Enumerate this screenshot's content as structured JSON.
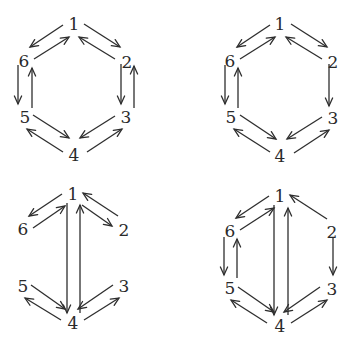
{
  "figure": {
    "panels": [
      {
        "id": "top-left",
        "nodes": [
          {
            "id": "1",
            "label": "1",
            "x": 74,
            "y": 24
          },
          {
            "id": "2",
            "label": "2",
            "x": 127,
            "y": 62
          },
          {
            "id": "3",
            "label": "3",
            "x": 126,
            "y": 117
          },
          {
            "id": "4",
            "label": "4",
            "x": 74,
            "y": 155
          },
          {
            "id": "5",
            "label": "5",
            "x": 25,
            "y": 117
          },
          {
            "id": "6",
            "label": "6",
            "x": 24,
            "y": 61
          }
        ],
        "edges": [
          {
            "from": "1",
            "to": "6",
            "x1": 63,
            "y1": 25,
            "x2": 30,
            "y2": 47
          },
          {
            "from": "6",
            "to": "1",
            "x1": 34,
            "y1": 59,
            "x2": 69,
            "y2": 37
          },
          {
            "from": "2",
            "to": "1",
            "x1": 115,
            "y1": 59,
            "x2": 79,
            "y2": 37
          },
          {
            "from": "1",
            "to": "2",
            "x1": 84,
            "y1": 24,
            "x2": 120,
            "y2": 47
          },
          {
            "from": "6",
            "to": "5",
            "x1": 18,
            "y1": 65,
            "x2": 18,
            "y2": 104
          },
          {
            "from": "5",
            "to": "6",
            "x1": 32,
            "y1": 108,
            "x2": 32,
            "y2": 68
          },
          {
            "from": "2",
            "to": "3",
            "x1": 121,
            "y1": 64,
            "x2": 121,
            "y2": 104
          },
          {
            "from": "3",
            "to": "2",
            "x1": 134,
            "y1": 108,
            "x2": 134,
            "y2": 66
          },
          {
            "from": "5",
            "to": "4",
            "x1": 33,
            "y1": 115,
            "x2": 69,
            "y2": 138
          },
          {
            "from": "4",
            "to": "5",
            "x1": 63,
            "y1": 152,
            "x2": 27,
            "y2": 129
          },
          {
            "from": "3",
            "to": "4",
            "x1": 115,
            "y1": 116,
            "x2": 80,
            "y2": 138
          },
          {
            "from": "4",
            "to": "3",
            "x1": 87,
            "y1": 152,
            "x2": 122,
            "y2": 129
          }
        ]
      },
      {
        "id": "top-right",
        "nodes": [
          {
            "id": "1",
            "label": "1",
            "x": 280,
            "y": 24
          },
          {
            "id": "2",
            "label": "2",
            "x": 333,
            "y": 62
          },
          {
            "id": "3",
            "label": "3",
            "x": 333,
            "y": 118
          },
          {
            "id": "4",
            "label": "4",
            "x": 280,
            "y": 156
          },
          {
            "id": "5",
            "label": "5",
            "x": 231,
            "y": 117
          },
          {
            "id": "6",
            "label": "6",
            "x": 230,
            "y": 61
          }
        ],
        "edges": [
          {
            "from": "1",
            "to": "6",
            "x1": 270,
            "y1": 25,
            "x2": 237,
            "y2": 47
          },
          {
            "from": "6",
            "to": "1",
            "x1": 240,
            "y1": 59,
            "x2": 275,
            "y2": 37
          },
          {
            "from": "1",
            "to": "2",
            "x1": 291,
            "y1": 24,
            "x2": 327,
            "y2": 47
          },
          {
            "from": "2",
            "to": "1",
            "x1": 322,
            "y1": 59,
            "x2": 286,
            "y2": 37
          },
          {
            "from": "6",
            "to": "5",
            "x1": 225,
            "y1": 65,
            "x2": 225,
            "y2": 104
          },
          {
            "from": "5",
            "to": "6",
            "x1": 238,
            "y1": 108,
            "x2": 238,
            "y2": 68
          },
          {
            "from": "2",
            "to": "3",
            "x1": 329,
            "y1": 64,
            "x2": 329,
            "y2": 106
          },
          {
            "from": "5",
            "to": "4",
            "x1": 240,
            "y1": 115,
            "x2": 276,
            "y2": 139
          },
          {
            "from": "4",
            "to": "5",
            "x1": 270,
            "y1": 152,
            "x2": 234,
            "y2": 129
          },
          {
            "from": "3",
            "to": "4",
            "x1": 322,
            "y1": 117,
            "x2": 287,
            "y2": 139
          },
          {
            "from": "4",
            "to": "3",
            "x1": 294,
            "y1": 153,
            "x2": 329,
            "y2": 130
          }
        ]
      },
      {
        "id": "bottom-left",
        "nodes": [
          {
            "id": "1",
            "label": "1",
            "x": 73,
            "y": 194
          },
          {
            "id": "2",
            "label": "2",
            "x": 124,
            "y": 230
          },
          {
            "id": "3",
            "label": "3",
            "x": 124,
            "y": 286
          },
          {
            "id": "4",
            "label": "4",
            "x": 73,
            "y": 323
          },
          {
            "id": "5",
            "label": "5",
            "x": 23,
            "y": 286
          },
          {
            "id": "6",
            "label": "6",
            "x": 23,
            "y": 229
          }
        ],
        "edges": [
          {
            "from": "1",
            "to": "6",
            "x1": 62,
            "y1": 194,
            "x2": 29,
            "y2": 216
          },
          {
            "from": "6",
            "to": "1",
            "x1": 33,
            "y1": 228,
            "x2": 65,
            "y2": 206
          },
          {
            "from": "1",
            "to": "2",
            "x1": 82,
            "y1": 205,
            "x2": 112,
            "y2": 226
          },
          {
            "from": "2",
            "to": "1",
            "x1": 118,
            "y1": 216,
            "x2": 83,
            "y2": 193
          },
          {
            "from": "1",
            "to": "4",
            "x1": 67,
            "y1": 203,
            "x2": 67,
            "y2": 313
          },
          {
            "from": "4",
            "to": "1",
            "x1": 80,
            "y1": 313,
            "x2": 80,
            "y2": 205
          },
          {
            "from": "5",
            "to": "4",
            "x1": 31,
            "y1": 285,
            "x2": 65,
            "y2": 309
          },
          {
            "from": "4",
            "to": "5",
            "x1": 61,
            "y1": 320,
            "x2": 25,
            "y2": 298
          },
          {
            "from": "3",
            "to": "4",
            "x1": 113,
            "y1": 285,
            "x2": 78,
            "y2": 309
          },
          {
            "from": "4",
            "to": "3",
            "x1": 84,
            "y1": 320,
            "x2": 119,
            "y2": 298
          }
        ]
      },
      {
        "id": "bottom-right",
        "nodes": [
          {
            "id": "1",
            "label": "1",
            "x": 280,
            "y": 196
          },
          {
            "id": "2",
            "label": "2",
            "x": 332,
            "y": 232
          },
          {
            "id": "3",
            "label": "3",
            "x": 332,
            "y": 289
          },
          {
            "id": "4",
            "label": "4",
            "x": 280,
            "y": 326
          },
          {
            "id": "5",
            "label": "5",
            "x": 230,
            "y": 288
          },
          {
            "id": "6",
            "label": "6",
            "x": 230,
            "y": 231
          }
        ],
        "edges": [
          {
            "from": "1",
            "to": "6",
            "x1": 269,
            "y1": 196,
            "x2": 236,
            "y2": 218
          },
          {
            "from": "6",
            "to": "1",
            "x1": 240,
            "y1": 230,
            "x2": 274,
            "y2": 208
          },
          {
            "from": "2",
            "to": "1",
            "x1": 327,
            "y1": 219,
            "x2": 290,
            "y2": 195
          },
          {
            "from": "6",
            "to": "5",
            "x1": 224,
            "y1": 237,
            "x2": 224,
            "y2": 275
          },
          {
            "from": "5",
            "to": "6",
            "x1": 237,
            "y1": 278,
            "x2": 237,
            "y2": 239
          },
          {
            "from": "2",
            "to": "3",
            "x1": 333,
            "y1": 238,
            "x2": 333,
            "y2": 275
          },
          {
            "from": "1",
            "to": "4",
            "x1": 274,
            "y1": 205,
            "x2": 274,
            "y2": 315
          },
          {
            "from": "4",
            "to": "1",
            "x1": 288,
            "y1": 315,
            "x2": 288,
            "y2": 208
          },
          {
            "from": "5",
            "to": "4",
            "x1": 238,
            "y1": 287,
            "x2": 274,
            "y2": 312
          },
          {
            "from": "4",
            "to": "5",
            "x1": 267,
            "y1": 323,
            "x2": 231,
            "y2": 300
          },
          {
            "from": "3",
            "to": "4",
            "x1": 320,
            "y1": 287,
            "x2": 284,
            "y2": 312
          },
          {
            "from": "4",
            "to": "3",
            "x1": 291,
            "y1": 323,
            "x2": 327,
            "y2": 300
          }
        ]
      }
    ],
    "colors": {
      "stroke": "#2e2e2e",
      "label": "#2a2a2a",
      "background": "#ffffff"
    }
  }
}
